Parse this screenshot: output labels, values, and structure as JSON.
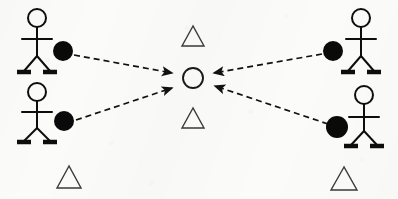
{
  "scene": {
    "title": "Four people kicking balls toward a central target",
    "width": 398,
    "height": 199,
    "background_color": "#fbfbfa",
    "ink_color": "#0d0d0d",
    "outline_color": "#3a3a3a"
  },
  "actors": [
    {
      "id": "person-top-left",
      "label": "stick figure top left",
      "facing": "right",
      "head": {
        "cx": 37,
        "cy": 18,
        "r": 9
      },
      "body": {
        "x": 37,
        "y1": 27,
        "y2": 56
      },
      "arms": {
        "y": 39,
        "x1": 22,
        "x2": 52
      },
      "legs": {
        "hip_x": 37,
        "hip_y": 56,
        "left_x": 24,
        "right_x": 50,
        "foot_y": 71
      },
      "feet": [
        {
          "x1": 17,
          "x2": 31,
          "y": 72
        },
        {
          "x1": 43,
          "x2": 57,
          "y": 72
        }
      ],
      "ball": {
        "id": "ball-top-left",
        "cx": 63,
        "cy": 51,
        "r": 10,
        "color": "#0a0a0a"
      }
    },
    {
      "id": "person-bottom-left",
      "label": "stick figure bottom left",
      "facing": "right",
      "head": {
        "cx": 37,
        "cy": 92,
        "r": 9
      },
      "body": {
        "x": 37,
        "y1": 101,
        "y2": 128
      },
      "arms": {
        "y": 112,
        "x1": 22,
        "x2": 52
      },
      "legs": {
        "hip_x": 37,
        "hip_y": 128,
        "left_x": 24,
        "right_x": 50,
        "foot_y": 141
      },
      "feet": [
        {
          "x1": 17,
          "x2": 31,
          "y": 142
        },
        {
          "x1": 43,
          "x2": 57,
          "y": 142
        }
      ],
      "ball": {
        "id": "ball-bottom-left",
        "cx": 64,
        "cy": 121,
        "r": 10,
        "color": "#0a0a0a"
      }
    },
    {
      "id": "person-top-right",
      "label": "stick figure top right",
      "facing": "left",
      "head": {
        "cx": 361,
        "cy": 18,
        "r": 9
      },
      "body": {
        "x": 361,
        "y1": 27,
        "y2": 56
      },
      "arms": {
        "y": 39,
        "x1": 346,
        "x2": 376
      },
      "legs": {
        "hip_x": 361,
        "hip_y": 56,
        "left_x": 348,
        "right_x": 374,
        "foot_y": 71
      },
      "feet": [
        {
          "x1": 341,
          "x2": 355,
          "y": 72
        },
        {
          "x1": 367,
          "x2": 381,
          "y": 72
        }
      ],
      "ball": {
        "id": "ball-top-right",
        "cx": 333,
        "cy": 51,
        "r": 10,
        "color": "#0a0a0a"
      }
    },
    {
      "id": "person-bottom-right",
      "label": "stick figure bottom right",
      "facing": "left",
      "head": {
        "cx": 364,
        "cy": 95,
        "r": 9
      },
      "body": {
        "x": 364,
        "y1": 104,
        "y2": 131
      },
      "arms": {
        "y": 117,
        "x1": 349,
        "x2": 379,
        "y2": 117
      },
      "legs": {
        "hip_x": 364,
        "hip_y": 131,
        "left_x": 351,
        "right_x": 377,
        "foot_y": 145
      },
      "feet": [
        {
          "x1": 344,
          "x2": 358,
          "y": 146
        },
        {
          "x1": 370,
          "x2": 384,
          "y": 146
        }
      ],
      "ball": {
        "id": "ball-bottom-right",
        "cx": 337,
        "cy": 127,
        "r": 11,
        "color": "#0a0a0a"
      }
    }
  ],
  "target": {
    "id": "center-target-circle",
    "label": "central target circle",
    "cx": 193,
    "cy": 78,
    "r": 10,
    "stroke": "#1a1a1a",
    "fill": "none"
  },
  "triangles": [
    {
      "id": "triangle-center-top",
      "label": "triangle above target",
      "cx": 193,
      "base_y": 46,
      "half_w": 11,
      "height": 20
    },
    {
      "id": "triangle-center-bottom",
      "label": "triangle below target",
      "cx": 193,
      "base_y": 128,
      "half_w": 11,
      "height": 20
    },
    {
      "id": "triangle-bottom-left",
      "label": "triangle bottom left",
      "cx": 69,
      "base_y": 188,
      "half_w": 12,
      "height": 22
    },
    {
      "id": "triangle-bottom-right",
      "label": "triangle bottom right",
      "cx": 344,
      "base_y": 190,
      "half_w": 13,
      "height": 23
    }
  ],
  "arrows": [
    {
      "id": "arrow-top-left-to-target",
      "label": "dashed arrow from top left ball to target",
      "from": {
        "x": 74,
        "y": 55
      },
      "to": {
        "x": 172,
        "y": 73
      },
      "style": "dashed",
      "dash": "6 4",
      "color": "#111111"
    },
    {
      "id": "arrow-bottom-left-to-target",
      "label": "dashed arrow from bottom left ball to target",
      "from": {
        "x": 76,
        "y": 120
      },
      "to": {
        "x": 172,
        "y": 88
      },
      "style": "dashed",
      "dash": "6 4",
      "color": "#111111"
    },
    {
      "id": "arrow-top-right-to-target",
      "label": "dashed arrow from top right ball to target",
      "from": {
        "x": 322,
        "y": 54
      },
      "to": {
        "x": 214,
        "y": 73
      },
      "style": "dashed",
      "dash": "6 4",
      "color": "#111111"
    },
    {
      "id": "arrow-bottom-right-to-target",
      "label": "dashed arrow from bottom right ball to target",
      "from": {
        "x": 328,
        "y": 124
      },
      "to": {
        "x": 215,
        "y": 86
      },
      "style": "dashed",
      "dash": "6 4",
      "color": "#111111"
    }
  ]
}
